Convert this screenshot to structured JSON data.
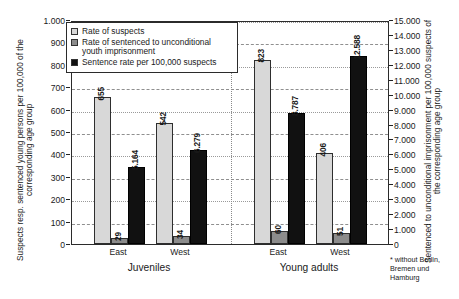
{
  "chart_data": {
    "type": "bar",
    "title": "",
    "subtitle": "",
    "grid": true,
    "legend_position": "top-left",
    "categories": [
      "East",
      "West",
      "East",
      "West"
    ],
    "groups": [
      {
        "name": "Juveniles",
        "categories": [
          "East",
          "West"
        ]
      },
      {
        "name": "Young adults",
        "categories": [
          "East",
          "West"
        ]
      }
    ],
    "series": [
      {
        "name": "Rate of suspects",
        "axis": "left",
        "color": "#d8d8d8",
        "values": [
          655,
          542,
          823,
          406
        ],
        "labels": [
          "655",
          "542",
          "823",
          "406"
        ]
      },
      {
        "name": "Rate of sentenced to unconditional youth imprisonment",
        "axis": "left",
        "color": "#8c8c8c",
        "values": [
          29,
          34,
          60,
          51
        ],
        "labels": [
          "29",
          "34",
          "60",
          "51"
        ]
      },
      {
        "name": "Sentence rate per 100,000 suspects",
        "axis": "right",
        "color": "#111111",
        "values": [
          5.164,
          6.279,
          8.787,
          12.588
        ],
        "labels": [
          "5.164",
          "6.279",
          "8.787",
          "12.588"
        ]
      }
    ],
    "xlabel": "",
    "ylabel": "Suspects resp. sentenced young persons per 100,000 of the corresponding age group",
    "y2label": "Sentenced to unconditional imprisonment per 100,000 suspects of the corresponding age group",
    "ylim": [
      0,
      1000
    ],
    "y2lim": [
      0,
      15
    ],
    "yticks": [
      "0",
      "100",
      "200",
      "300",
      "400",
      "500",
      "600",
      "700",
      "800",
      "900",
      "1.000"
    ],
    "y2ticks": [
      "0",
      "1.000",
      "2.000",
      "3.000",
      "4.000",
      "5.000",
      "6.000",
      "7.000",
      "8.000",
      "9.000",
      "10.000",
      "11.000",
      "12.000",
      "13.000",
      "14.000",
      "15.000"
    ],
    "annotations": [
      "* without Berlin, Bremen und Hamburg"
    ]
  },
  "axes": {
    "left_title": "Suspects resp. sentenced young persons per 100,000 of the corresponding age group",
    "right_title": "Sentenced to unconditional imprisonment per 100,000 suspects of the corresponding age group"
  },
  "legend": {
    "items": [
      {
        "label": "Rate of suspects",
        "color": "#d8d8d8"
      },
      {
        "label": "Rate of sentenced to unconditional youth imprisonment",
        "color": "#8c8c8c"
      },
      {
        "label": "Sentence rate per 100,000 suspects",
        "color": "#111111"
      }
    ]
  },
  "footnote": "* without Berlin,\nBremen und\nHamburg"
}
